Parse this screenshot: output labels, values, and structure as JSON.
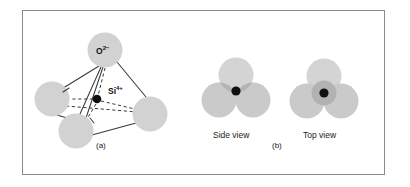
{
  "figure": {
    "panels": [
      {
        "id": "a",
        "caption": "(a)",
        "type": "tetrahedron-ball-and-stick",
        "labels": {
          "oxygen": "O",
          "oxygen_charge": "2−",
          "silicon": "Si",
          "silicon_charge": "4+"
        }
      },
      {
        "id": "b",
        "caption": "(b)",
        "type": "space-filling-views",
        "views": [
          {
            "id": "side",
            "label": "Side view"
          },
          {
            "id": "top",
            "label": "Top view"
          }
        ]
      }
    ],
    "colors": {
      "sphere_fill": "#d2d2d2",
      "sphere_overlap": "#b0b0b0",
      "center_atom": "#101010",
      "bond_line": "#3a3a3a",
      "frame_border": "#8a8a8a",
      "background": "#ffffff",
      "text": "#111111"
    },
    "atoms_panel_a": [
      {
        "name": "oxygen-top",
        "cx": 105,
        "cy": 50,
        "r": 17.5
      },
      {
        "name": "oxygen-left",
        "cx": 52,
        "cy": 99,
        "r": 17.5
      },
      {
        "name": "oxygen-bottom-front",
        "cx": 76,
        "cy": 131,
        "r": 17.5
      },
      {
        "name": "oxygen-right",
        "cx": 150,
        "cy": 114,
        "r": 17.5
      },
      {
        "name": "silicon-center",
        "cx": 97,
        "cy": 99,
        "r": 4.3
      }
    ],
    "atoms_panel_b": {
      "side_view": [
        {
          "name": "sphere-back-top",
          "cx": 236,
          "cy": 75,
          "r": 17.5
        },
        {
          "name": "sphere-front-left",
          "cx": 219,
          "cy": 100,
          "r": 17.5
        },
        {
          "name": "sphere-front-right",
          "cx": 253,
          "cy": 100,
          "r": 17.5
        },
        {
          "name": "silicon-center",
          "cx": 236,
          "cy": 91,
          "r": 4.6
        }
      ],
      "top_view": [
        {
          "name": "sphere-top",
          "cx": 324,
          "cy": 76,
          "r": 17.5
        },
        {
          "name": "sphere-bottom-left",
          "cx": 307,
          "cy": 101,
          "r": 17.5
        },
        {
          "name": "sphere-bottom-right",
          "cx": 341,
          "cy": 101,
          "r": 17.5
        },
        {
          "name": "overlap-disc",
          "cx": 324,
          "cy": 93,
          "r": 12.5
        },
        {
          "name": "silicon-center",
          "cx": 324,
          "cy": 93,
          "r": 4.6
        }
      ]
    }
  }
}
